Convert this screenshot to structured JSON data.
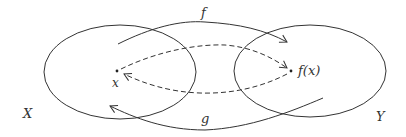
{
  "diagram": {
    "type": "function-mapping",
    "sets": [
      {
        "id": "X",
        "label": "X",
        "ellipse": {
          "cx": 120,
          "cy": 72,
          "rx": 76,
          "ry": 47
        }
      },
      {
        "id": "Y",
        "label": "Y",
        "ellipse": {
          "cx": 310,
          "cy": 71,
          "rx": 76,
          "ry": 46
        }
      }
    ],
    "points": [
      {
        "id": "x",
        "label": "x",
        "x": 117,
        "y": 71
      },
      {
        "id": "fx",
        "label": "f(x)",
        "x": 291,
        "y": 71
      }
    ],
    "arrows": [
      {
        "id": "f",
        "label": "f",
        "from": "X",
        "to": "Y",
        "style": "solid"
      },
      {
        "id": "g",
        "label": "g",
        "from": "Y",
        "to": "X",
        "style": "solid"
      },
      {
        "id": "x-to-fx",
        "label": "",
        "from": "x",
        "to": "f(x)",
        "style": "dashed"
      },
      {
        "id": "fx-to-x",
        "label": "",
        "from": "f(x)",
        "to": "x",
        "style": "dashed"
      }
    ],
    "colors": {
      "stroke": "#333333",
      "background": "#ffffff"
    }
  }
}
